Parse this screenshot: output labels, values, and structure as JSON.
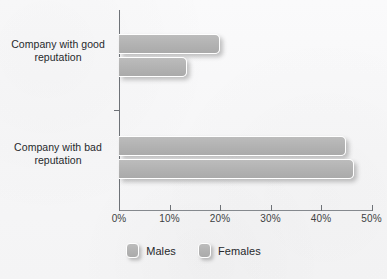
{
  "chart_data": {
    "type": "bar",
    "orientation": "horizontal",
    "title": "",
    "subtitle": "",
    "xlabel": "",
    "ylabel": "",
    "categories": [
      "Company with good reputation",
      "Company with bad reputation"
    ],
    "series": [
      {
        "name": "Males",
        "values": [
          20,
          45
        ]
      },
      {
        "name": "Females",
        "values": [
          13.5,
          46.5
        ]
      }
    ],
    "xlim": [
      0,
      50
    ],
    "x_tick_values": [
      0,
      10,
      20,
      30,
      40,
      50
    ],
    "x_tick_labels": [
      "0%",
      "10%",
      "20%",
      "30%",
      "40%",
      "50%"
    ],
    "value_suffix": "%",
    "grid": false,
    "legend_position": "bottom-center",
    "legend_entries": [
      "Males",
      "Females"
    ],
    "colors": {
      "bar_fill": "#b3b3b3",
      "bar_border": "#ffffff",
      "axis": "#6e7277",
      "text": "#26292c",
      "background": "#f8f8f9"
    }
  },
  "axis": {
    "tick_labels": [
      "0%",
      "10%",
      "20%",
      "30%",
      "40%",
      "50%"
    ]
  },
  "categories": {
    "good": {
      "line1": "Company with good",
      "line2": "reputation"
    },
    "bad": {
      "line1": "Company with bad",
      "line2": "reputation"
    }
  },
  "legend": {
    "males": "Males",
    "females": "Females"
  },
  "title_sliver": "",
  "bars": {
    "good_males": {
      "label": "Males",
      "value": "20%"
    },
    "good_females": {
      "label": "Females",
      "value": "13.5%"
    },
    "bad_males": {
      "label": "Males",
      "value": "45%"
    },
    "bad_females": {
      "label": "Females",
      "value": "46.5%"
    }
  }
}
